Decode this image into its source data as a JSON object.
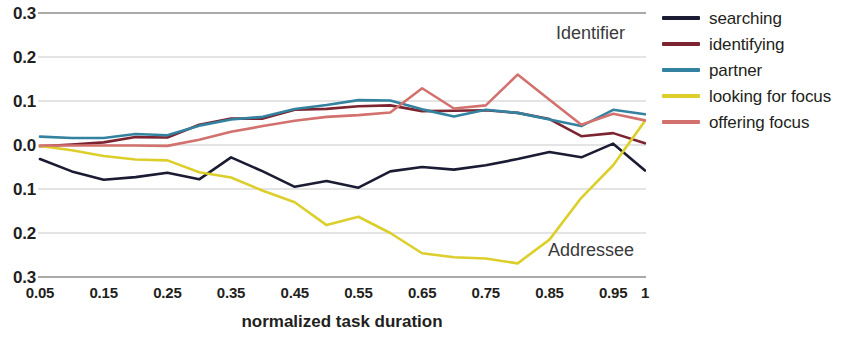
{
  "chart_data": {
    "type": "line",
    "title": "",
    "xlabel": "normalized task duration",
    "ylabel": "",
    "x": [
      0.05,
      0.1,
      0.15,
      0.2,
      0.25,
      0.3,
      0.35,
      0.4,
      0.45,
      0.5,
      0.55,
      0.6,
      0.65,
      0.7,
      0.75,
      0.8,
      0.85,
      0.9,
      0.95,
      1.0
    ],
    "x_tick_labels": [
      "0.05",
      "0.15",
      "0.25",
      "0.35",
      "0.45",
      "0.55",
      "0.65",
      "0.75",
      "0.85",
      "0.95",
      "1"
    ],
    "x_tick_values": [
      0.05,
      0.15,
      0.25,
      0.35,
      0.45,
      0.55,
      0.65,
      0.75,
      0.85,
      0.95,
      1.0
    ],
    "y_tick_labels": [
      "0.3",
      "0.2",
      "0.1",
      "0.0",
      "0.1",
      "0.2",
      "0.3"
    ],
    "y_tick_values": [
      0.3,
      0.2,
      0.1,
      0.0,
      -0.1,
      -0.2,
      -0.3
    ],
    "xlim": [
      0.05,
      1.0
    ],
    "ylim": [
      -0.3,
      0.3
    ],
    "grid": true,
    "legend_position": "right",
    "annotations": [
      {
        "text": "Identifier",
        "x": 0.82,
        "y": 0.245
      },
      {
        "text": "Addressee",
        "x": 0.81,
        "y": -0.215
      }
    ],
    "series": [
      {
        "name": "searching",
        "color": "#1b1c33",
        "values": [
          -0.032,
          -0.06,
          -0.079,
          -0.073,
          -0.063,
          -0.078,
          -0.028,
          -0.06,
          -0.095,
          -0.082,
          -0.097,
          -0.06,
          -0.05,
          -0.056,
          -0.046,
          -0.032,
          -0.016,
          -0.028,
          0.003,
          -0.058
        ]
      },
      {
        "name": "identifying",
        "color": "#7c2430",
        "values": [
          -0.003,
          0.001,
          0.006,
          0.018,
          0.017,
          0.046,
          0.06,
          0.06,
          0.08,
          0.082,
          0.088,
          0.09,
          0.077,
          0.078,
          0.079,
          0.073,
          0.059,
          0.02,
          0.027,
          0.004
        ]
      },
      {
        "name": "partner",
        "color": "#3382a0",
        "values": [
          0.019,
          0.016,
          0.016,
          0.025,
          0.022,
          0.044,
          0.058,
          0.064,
          0.082,
          0.091,
          0.102,
          0.101,
          0.081,
          0.065,
          0.08,
          0.073,
          0.058,
          0.043,
          0.08,
          0.07
        ]
      },
      {
        "name": "looking for focus",
        "color": "#dccf2c",
        "values": [
          -0.002,
          -0.012,
          -0.025,
          -0.033,
          -0.035,
          -0.062,
          -0.074,
          -0.104,
          -0.13,
          -0.182,
          -0.163,
          -0.2,
          -0.246,
          -0.255,
          -0.258,
          -0.269,
          -0.215,
          -0.12,
          -0.046,
          0.055
        ]
      },
      {
        "name": "offering focus",
        "color": "#d2716e",
        "values": [
          -0.001,
          -0.001,
          -0.001,
          -0.001,
          -0.002,
          0.012,
          0.03,
          0.043,
          0.055,
          0.064,
          0.068,
          0.074,
          0.129,
          0.083,
          0.09,
          0.16,
          0.103,
          0.046,
          0.071,
          0.056
        ]
      }
    ]
  },
  "legend": {
    "items": [
      {
        "label": "searching",
        "color": "#1b1c33"
      },
      {
        "label": "identifying",
        "color": "#7c2430"
      },
      {
        "label": "partner",
        "color": "#3382a0"
      },
      {
        "label": "looking for focus",
        "color": "#dccf2c"
      },
      {
        "label": "offering focus",
        "color": "#d2716e"
      }
    ]
  }
}
